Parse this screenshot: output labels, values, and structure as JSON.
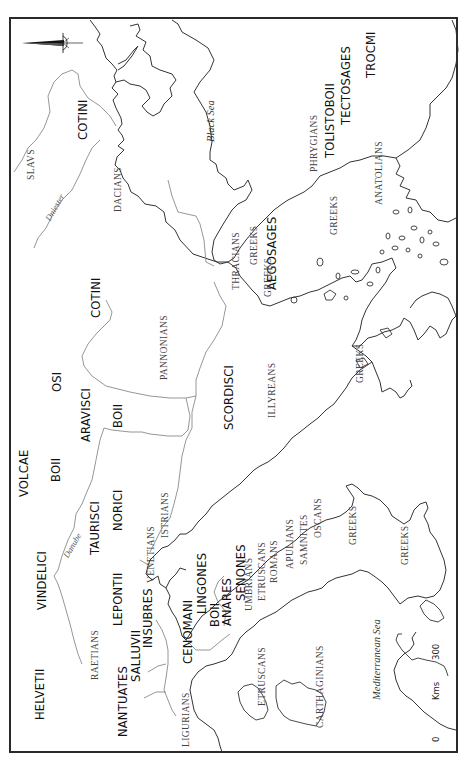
{
  "map": {
    "orientation": "rotated 90 degrees counter-clockwise (north arrow points left)",
    "compass": {
      "icon": "north-arrow-icon",
      "direction": "left"
    },
    "scale_bar": {
      "start_label": "0",
      "end_label": "300",
      "unit_label": "Kms"
    },
    "seas": [
      {
        "name": "Black Sea",
        "x": 222,
        "y": 142
      },
      {
        "name": "Mediterranean Sea",
        "x": 375,
        "y": 697
      }
    ],
    "rivers": [
      {
        "name": "Dniester",
        "x": 44,
        "y": 218
      },
      {
        "name": "Danube",
        "x": 62,
        "y": 557
      }
    ],
    "celtic_tribes": [
      {
        "name": "COTINI",
        "x": 84,
        "y": 140
      },
      {
        "name": "COTINI",
        "x": 97,
        "y": 318
      },
      {
        "name": "OSI",
        "x": 52,
        "y": 392
      },
      {
        "name": "VOLCAE",
        "x": 19,
        "y": 497
      },
      {
        "name": "BOII",
        "x": 50,
        "y": 482
      },
      {
        "name": "ARAVISCI",
        "x": 81,
        "y": 442
      },
      {
        "name": "BOII",
        "x": 113,
        "y": 428
      },
      {
        "name": "SCORDISCI",
        "x": 225,
        "y": 428
      },
      {
        "name": "AEGOSAGES",
        "x": 267,
        "y": 288
      },
      {
        "name": "TOLISTOBOII",
        "x": 326,
        "y": 159
      },
      {
        "name": "TECTOSAGES",
        "x": 341,
        "y": 125
      },
      {
        "name": "TROCMI",
        "x": 366,
        "y": 78
      },
      {
        "name": "VINDELICI",
        "x": 37,
        "y": 610
      },
      {
        "name": "TAURISCI",
        "x": 88,
        "y": 555
      },
      {
        "name": "NORICI",
        "x": 114,
        "y": 530
      },
      {
        "name": "HELVETII",
        "x": 35,
        "y": 720
      },
      {
        "name": "LEPONTII",
        "x": 113,
        "y": 625
      },
      {
        "name": "NANTUATES",
        "x": 118,
        "y": 735
      },
      {
        "name": "SALLUVII",
        "x": 131,
        "y": 682
      },
      {
        "name": "INSUBRES",
        "x": 142,
        "y": 647
      },
      {
        "name": "CENOMANI",
        "x": 184,
        "y": 663
      },
      {
        "name": "LINGONES",
        "x": 197,
        "y": 613
      },
      {
        "name": "BOII",
        "x": 210,
        "y": 627
      },
      {
        "name": "ANARES",
        "x": 222,
        "y": 625
      },
      {
        "name": "SENONES",
        "x": 236,
        "y": 600
      }
    ],
    "peoples": [
      {
        "name": "SLAVS",
        "x": 27,
        "y": 180
      },
      {
        "name": "DACIANS",
        "x": 114,
        "y": 212
      },
      {
        "name": "PANNONIANS",
        "x": 160,
        "y": 380
      },
      {
        "name": "THRACIANS",
        "x": 232,
        "y": 290
      },
      {
        "name": "GREEKS",
        "x": 250,
        "y": 265
      },
      {
        "name": "GREEKS",
        "x": 264,
        "y": 297
      },
      {
        "name": "PHRYGIANS",
        "x": 310,
        "y": 172
      },
      {
        "name": "GREEKS",
        "x": 330,
        "y": 235
      },
      {
        "name": "ANATOLIANS",
        "x": 375,
        "y": 205
      },
      {
        "name": "ILLYREANS",
        "x": 268,
        "y": 418
      },
      {
        "name": "GREEKS",
        "x": 356,
        "y": 383
      },
      {
        "name": "ISTRIANS",
        "x": 161,
        "y": 538
      },
      {
        "name": "VENETIANS",
        "x": 147,
        "y": 583
      },
      {
        "name": "RAETIANS",
        "x": 91,
        "y": 680
      },
      {
        "name": "LIGURIANS",
        "x": 182,
        "y": 747
      },
      {
        "name": "UMBRIANS",
        "x": 245,
        "y": 611
      },
      {
        "name": "ETRUSCANS",
        "x": 258,
        "y": 601
      },
      {
        "name": "ROMANS",
        "x": 270,
        "y": 583
      },
      {
        "name": "APULIANS",
        "x": 286,
        "y": 569
      },
      {
        "name": "SAMNITES",
        "x": 300,
        "y": 565
      },
      {
        "name": "OSCANS",
        "x": 314,
        "y": 538
      },
      {
        "name": "GREEKS",
        "x": 349,
        "y": 545
      },
      {
        "name": "GREEKS",
        "x": 401,
        "y": 565
      },
      {
        "name": "ETRUSCANS",
        "x": 258,
        "y": 706
      },
      {
        "name": "CARTHAGINIANS",
        "x": 316,
        "y": 728
      }
    ]
  }
}
